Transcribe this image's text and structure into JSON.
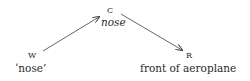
{
  "diagram": {
    "nodes": [
      {
        "id": "W",
        "label": "W",
        "gloss": "‘nose’"
      },
      {
        "id": "C",
        "label": "C",
        "gloss": "nose"
      },
      {
        "id": "R",
        "label": "R",
        "gloss": "front of aeroplane"
      }
    ],
    "edges": [
      {
        "from": "W",
        "to": "C"
      },
      {
        "from": "C",
        "to": "R"
      }
    ],
    "colors": {
      "line": "#555555",
      "text": "#2a2a2a"
    }
  }
}
